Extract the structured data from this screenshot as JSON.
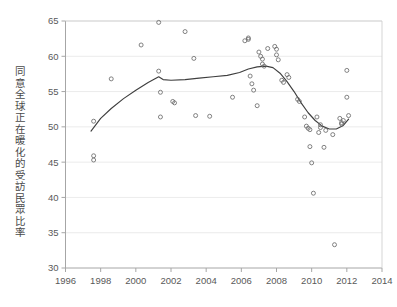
{
  "chart_data": {
    "type": "scatter",
    "title": "",
    "xlabel": "",
    "ylabel": "同意全球正在暖化的受訪民眾比率",
    "xlim": [
      1996,
      2014
    ],
    "ylim": [
      30,
      65
    ],
    "xticks": [
      1996,
      1998,
      2000,
      2002,
      2004,
      2006,
      2008,
      2010,
      2012,
      2014
    ],
    "yticks": [
      30,
      35,
      40,
      45,
      50,
      55,
      60,
      65
    ],
    "grid": "horizontal",
    "legend": "none",
    "marker": "open-circle",
    "series": [
      {
        "name": "調查結果",
        "type": "scatter",
        "points": [
          [
            1997.6,
            50.8
          ],
          [
            1997.6,
            45.9
          ],
          [
            1997.6,
            45.3
          ],
          [
            1998.6,
            56.8
          ],
          [
            2000.3,
            61.6
          ],
          [
            2001.3,
            64.8
          ],
          [
            2001.3,
            57.9
          ],
          [
            2001.4,
            54.9
          ],
          [
            2001.4,
            51.4
          ],
          [
            2002.1,
            53.6
          ],
          [
            2002.2,
            53.4
          ],
          [
            2002.8,
            63.5
          ],
          [
            2003.3,
            59.7
          ],
          [
            2003.4,
            51.6
          ],
          [
            2004.2,
            51.5
          ],
          [
            2005.5,
            54.2
          ],
          [
            2006.2,
            62.2
          ],
          [
            2006.4,
            62.4
          ],
          [
            2006.4,
            62.6
          ],
          [
            2006.5,
            57.2
          ],
          [
            2006.6,
            56.1
          ],
          [
            2006.7,
            55.2
          ],
          [
            2006.9,
            53.0
          ],
          [
            2007.0,
            60.6
          ],
          [
            2007.1,
            60.0
          ],
          [
            2007.2,
            59.6
          ],
          [
            2007.2,
            58.9
          ],
          [
            2007.3,
            58.6
          ],
          [
            2007.5,
            61.1
          ],
          [
            2007.9,
            61.4
          ],
          [
            2008.0,
            61.0
          ],
          [
            2008.0,
            60.2
          ],
          [
            2008.1,
            59.5
          ],
          [
            2008.3,
            56.6
          ],
          [
            2008.4,
            56.3
          ],
          [
            2008.6,
            57.4
          ],
          [
            2008.7,
            57.0
          ],
          [
            2009.2,
            53.9
          ],
          [
            2009.3,
            53.6
          ],
          [
            2009.6,
            51.4
          ],
          [
            2009.7,
            50.1
          ],
          [
            2009.8,
            49.8
          ],
          [
            2009.9,
            49.6
          ],
          [
            2009.9,
            47.2
          ],
          [
            2010.0,
            44.9
          ],
          [
            2010.1,
            40.6
          ],
          [
            2010.3,
            51.4
          ],
          [
            2010.4,
            49.2
          ],
          [
            2010.5,
            50.3
          ],
          [
            2010.5,
            49.9
          ],
          [
            2010.7,
            47.1
          ],
          [
            2010.8,
            49.5
          ],
          [
            2011.2,
            48.9
          ],
          [
            2011.3,
            33.3
          ],
          [
            2011.6,
            51.2
          ],
          [
            2011.7,
            50.6
          ],
          [
            2011.7,
            50.4
          ],
          [
            2011.8,
            50.9
          ],
          [
            2012.0,
            58.0
          ],
          [
            2012.0,
            54.2
          ],
          [
            2012.1,
            51.6
          ]
        ]
      },
      {
        "name": "平滑趨勢線",
        "type": "line",
        "points": [
          [
            1997.45,
            49.4
          ],
          [
            1998.0,
            51.2
          ],
          [
            1998.6,
            52.6
          ],
          [
            1999.3,
            54.0
          ],
          [
            2000.0,
            55.2
          ],
          [
            2000.7,
            56.3
          ],
          [
            2001.3,
            57.1
          ],
          [
            2001.55,
            56.7
          ],
          [
            2002.0,
            56.6
          ],
          [
            2002.8,
            56.7
          ],
          [
            2003.6,
            56.9
          ],
          [
            2004.4,
            57.1
          ],
          [
            2005.2,
            57.3
          ],
          [
            2005.9,
            57.7
          ],
          [
            2006.4,
            58.2
          ],
          [
            2006.9,
            58.5
          ],
          [
            2007.4,
            58.6
          ],
          [
            2007.8,
            58.4
          ],
          [
            2008.2,
            57.6
          ],
          [
            2008.6,
            56.4
          ],
          [
            2009.0,
            55.0
          ],
          [
            2009.4,
            53.4
          ],
          [
            2009.8,
            52.0
          ],
          [
            2010.2,
            50.9
          ],
          [
            2010.6,
            50.1
          ],
          [
            2011.0,
            49.7
          ],
          [
            2011.4,
            49.7
          ],
          [
            2011.8,
            50.2
          ],
          [
            2012.1,
            51.1
          ]
        ]
      }
    ]
  },
  "axis": {
    "y_tick_labels": [
      "65",
      "60",
      "55",
      "50",
      "45",
      "40",
      "35",
      "30"
    ],
    "x_tick_labels": [
      "1996",
      "1998",
      "2000",
      "2002",
      "2004",
      "2006",
      "2008",
      "2010",
      "2012",
      "2014"
    ]
  },
  "colors": {
    "marker_stroke": "#6b6b6b",
    "trend_line": "#3f3f3f",
    "gridline": "#e6e6e6",
    "axis": "#a6a6a6",
    "tick_text": "#595959",
    "label_text": "#4a4a4a",
    "background": "#ffffff"
  }
}
